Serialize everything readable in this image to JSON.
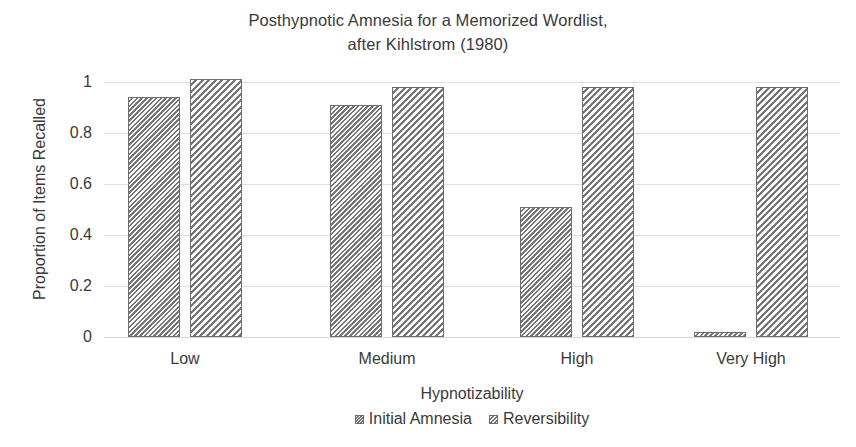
{
  "chart_data": {
    "type": "bar",
    "title": "Posthypnotic Amnesia for a Memorized Wordlist, after Kihlstrom (1980)",
    "title_line1": "Posthypnotic Amnesia for a Memorized Wordlist,",
    "title_line2": "after Kihlstrom (1980)",
    "xlabel": "Hypnotizability",
    "ylabel": "Proportion of Items Recalled",
    "categories": [
      "Low",
      "Medium",
      "High",
      "Very High"
    ],
    "series": [
      {
        "name": "Initial Amnesia",
        "values": [
          0.94,
          0.91,
          0.51,
          0.02
        ]
      },
      {
        "name": "Reversibility",
        "values": [
          1.01,
          0.98,
          0.98,
          0.98
        ]
      }
    ],
    "ylim": [
      0,
      1.05
    ],
    "yticks": [
      0,
      0.2,
      0.4,
      0.6,
      0.8,
      1
    ],
    "ytick_labels": [
      "0",
      "0.2",
      "0.4",
      "0.6",
      "0.8",
      "1"
    ],
    "grid": true,
    "grid_axis": "y",
    "legend_position": "bottom-center",
    "bar_style": "hatched-outline",
    "colors": {
      "hatch": "#767676",
      "bar_outline": "#6e6e6e",
      "bar_fill": "#ffffff",
      "gridline": "#d9d9d9",
      "text": "#3a3a3a",
      "background": "#ffffff"
    }
  }
}
